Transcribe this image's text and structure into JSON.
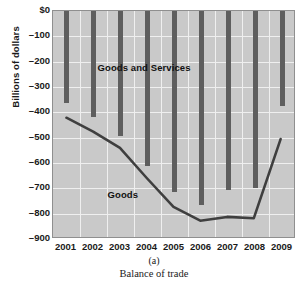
{
  "figure": {
    "caption_number": "(a)",
    "caption_text": "Balance of trade"
  },
  "axes": {
    "ylabel": "Billions of dollars",
    "yticks": [
      "$0",
      "–100",
      "–200",
      "–300",
      "–400",
      "–500",
      "–600",
      "–700",
      "–800",
      "–900"
    ],
    "xticks": [
      "2001",
      "2002",
      "2003",
      "2004",
      "2005",
      "2006",
      "2007",
      "2008",
      "2009"
    ]
  },
  "annotations": {
    "bars_label": "Goods and Services",
    "line_label": "Goods"
  },
  "colors": {
    "plot_background": "#c9c9c9",
    "gridline": "#efefef",
    "bar": "#5e5e5e",
    "line": "#3f3f3f",
    "frame": "#8f8f8f"
  },
  "chart_data": {
    "type": "bar",
    "title": "Balance of trade",
    "xlabel": "",
    "ylabel": "Billions of dollars",
    "categories": [
      "2001",
      "2002",
      "2003",
      "2004",
      "2005",
      "2006",
      "2007",
      "2008",
      "2009"
    ],
    "ylim": [
      -900,
      0
    ],
    "ytick_values": [
      0,
      -100,
      -200,
      -300,
      -400,
      -500,
      -600,
      -700,
      -800,
      -900
    ],
    "grid": true,
    "legend": "none",
    "series": [
      {
        "name": "Goods and Services",
        "render": "bar",
        "values": [
          -365,
          -420,
          -495,
          -610,
          -715,
          -765,
          -705,
          -700,
          -375
        ]
      },
      {
        "name": "Goods",
        "render": "line",
        "values": [
          -425,
          -480,
          -545,
          -665,
          -780,
          -835,
          -820,
          -825,
          -510
        ]
      }
    ]
  }
}
